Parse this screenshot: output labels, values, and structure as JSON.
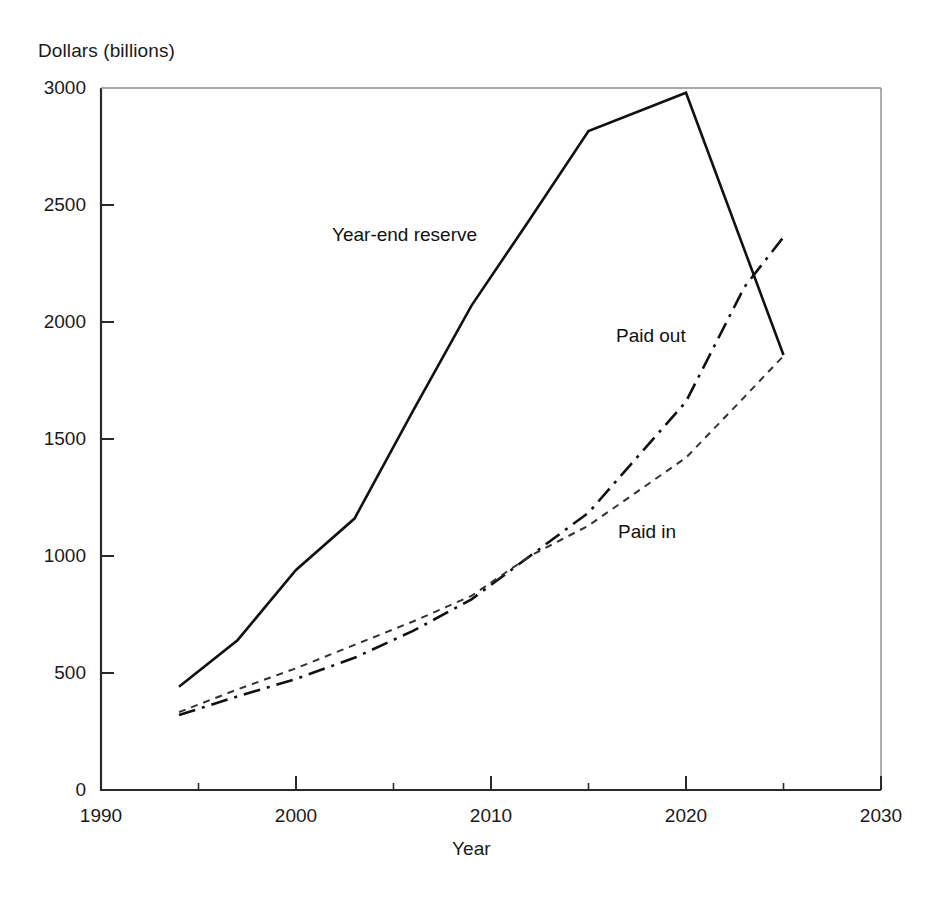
{
  "chart_data": {
    "type": "line",
    "title": "",
    "xlabel": "Year",
    "ylabel": "Dollars (billions)",
    "xlim": [
      1990,
      2030
    ],
    "ylim": [
      0,
      3000
    ],
    "grid": false,
    "legend_position": "inline-annotations",
    "x_ticks": [
      1990,
      2000,
      2010,
      2020,
      2030
    ],
    "x_minor_ticks": [
      1995,
      2005,
      2015,
      2025
    ],
    "y_ticks": [
      0,
      500,
      1000,
      1500,
      2000,
      2500,
      3000
    ],
    "x_tick_labels": [
      "1990",
      "2000",
      "2010",
      "2020",
      "2030"
    ],
    "y_tick_labels": [
      "0",
      "500",
      "1000",
      "1500",
      "2000",
      "2500",
      "3000"
    ],
    "series": [
      {
        "name": "Year-end reserve",
        "style": "solid",
        "color": "#111111",
        "label_x": 2008,
        "label_y": 2360,
        "x": [
          1994,
          1997,
          2000,
          2003,
          2006,
          2009,
          2012,
          2015,
          2020,
          2025
        ],
        "values": [
          441,
          640,
          940,
          1160,
          1620,
          2070,
          2440,
          2816,
          2980,
          1859
        ]
      },
      {
        "name": "Paid out",
        "style": "dash-dot",
        "color": "#111111",
        "label_x": 2018,
        "label_y": 1700,
        "x": [
          1994,
          1997,
          2000,
          2003,
          2006,
          2009,
          2012,
          2015,
          2020,
          2023,
          2025
        ],
        "values": [
          320,
          400,
          475,
          565,
          680,
          815,
          1000,
          1185,
          1660,
          2150,
          2363
        ]
      },
      {
        "name": "Paid in",
        "style": "dotted",
        "color": "#333333",
        "label_x": 2016,
        "label_y": 1050,
        "x": [
          1994,
          1997,
          2000,
          2003,
          2006,
          2009,
          2012,
          2015,
          2020,
          2023,
          2025
        ],
        "values": [
          333,
          430,
          520,
          620,
          720,
          830,
          1000,
          1130,
          1420,
          1680,
          1855
        ]
      }
    ]
  },
  "annotations": {
    "series_labels": [
      {
        "text": "Year-end reserve",
        "left": 332,
        "top": 224
      },
      {
        "text": "Paid out",
        "left": 616,
        "top": 325
      },
      {
        "text": "Paid in",
        "left": 618,
        "top": 521
      }
    ]
  },
  "axes": {
    "y_title": "Dollars (billions)",
    "x_title": "Year",
    "y_labels": [
      {
        "text": "3000",
        "top": 88
      },
      {
        "text": "2500",
        "top": 205
      },
      {
        "text": "2000",
        "top": 322
      },
      {
        "text": "1500",
        "top": 439
      },
      {
        "text": "1000",
        "top": 556
      },
      {
        "text": "500",
        "top": 673
      },
      {
        "text": "0",
        "top": 790
      }
    ],
    "x_labels": [
      {
        "text": "1990",
        "left": 101
      },
      {
        "text": "2000",
        "left": 296
      },
      {
        "text": "2010",
        "left": 491
      },
      {
        "text": "2020",
        "left": 686
      },
      {
        "text": "2030",
        "left": 881
      }
    ]
  }
}
